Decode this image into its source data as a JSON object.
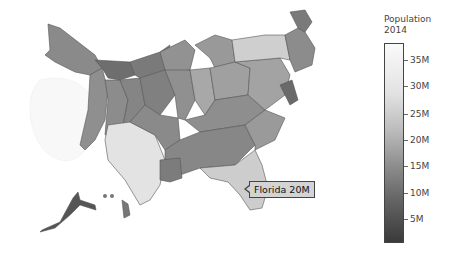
{
  "colorbar": {
    "title_line1": "Population",
    "title_line2": "2014",
    "ticks": [
      {
        "label": "35M",
        "y": 55
      },
      {
        "label": "30M",
        "y": 81
      },
      {
        "label": "25M",
        "y": 109
      },
      {
        "label": "20M",
        "y": 135
      },
      {
        "label": "15M",
        "y": 161
      },
      {
        "label": "10M",
        "y": 188
      },
      {
        "label": "5M",
        "y": 214
      }
    ],
    "range": [
      0,
      38.8
    ],
    "colorscale": [
      "#333333",
      "#fafafa"
    ]
  },
  "tooltip": {
    "text": "Florida 20M",
    "state": "Florida",
    "value": "20M"
  },
  "map": {
    "title": "US Population 2014 (cartogram)",
    "states": [
      {
        "name": "California",
        "value_m": 38.8,
        "color": "#f6f6f6"
      },
      {
        "name": "Texas",
        "value_m": 27.0,
        "color": "#e3e3e3"
      },
      {
        "name": "New York",
        "value_m": 19.7,
        "color": "#cfcfcf"
      },
      {
        "name": "Florida",
        "value_m": 19.9,
        "color": "#cdcdcd"
      },
      {
        "name": "Illinois",
        "value_m": 12.9,
        "color": "#a8a8a8"
      },
      {
        "name": "Pennsylvania",
        "value_m": 12.8,
        "color": "#a3a3a3"
      },
      {
        "name": "Ohio",
        "value_m": 11.6,
        "color": "#a0a0a0"
      },
      {
        "name": "Georgia",
        "value_m": 10.1,
        "color": "#9a9a9a"
      },
      {
        "name": "North Carolina",
        "value_m": 9.9,
        "color": "#999999"
      },
      {
        "name": "Michigan",
        "value_m": 9.9,
        "color": "#999999"
      },
      {
        "name": "Other states",
        "value_m": null,
        "color": "#888888"
      },
      {
        "name": "Small states",
        "value_m": null,
        "color": "#6e6e6e"
      }
    ]
  }
}
